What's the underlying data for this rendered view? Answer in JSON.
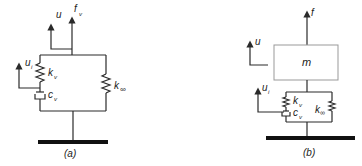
{
  "figure": {
    "panels": [
      {
        "id": "a",
        "caption": "(a)",
        "labels": {
          "u": "u",
          "f": "f",
          "f_sub": "v",
          "ui": "u",
          "ui_sub": "i",
          "kv": "k",
          "kv_sub": "v",
          "cv": "c",
          "cv_sub": "v",
          "kinf": "k",
          "kinf_sub": "∞"
        }
      },
      {
        "id": "b",
        "caption": "(b)",
        "labels": {
          "u": "u",
          "f": "f",
          "m": "m",
          "ui": "u",
          "ui_sub": "i",
          "kv": "k",
          "kv_sub": "v",
          "cv": "c",
          "cv_sub": "v",
          "kinf": "k",
          "kinf_sub": "∞"
        }
      }
    ],
    "colors": {
      "line": "#2a2a2a",
      "ground": "#111111",
      "mass_box": "#999999"
    }
  }
}
